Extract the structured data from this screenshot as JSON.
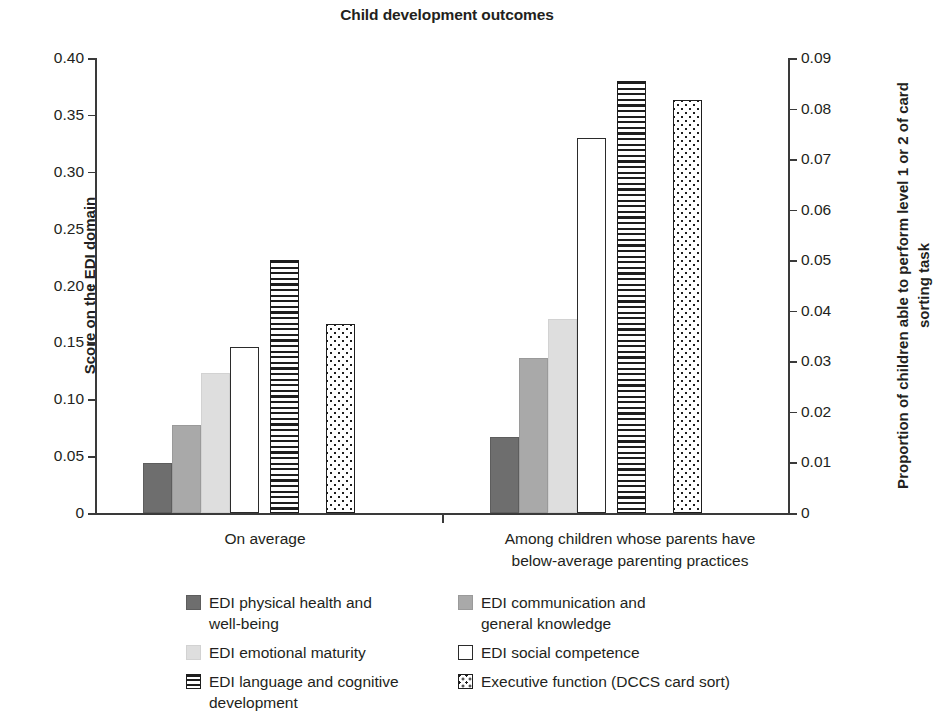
{
  "chart_data": {
    "type": "bar",
    "title": "Child development outcomes",
    "xlabel": "",
    "ylabel": "Score on the EDI domain",
    "y2label": "Proportion of children able to perform level 1 or 2 of card sorting task",
    "grid": false,
    "legend_position": "bottom",
    "ylim": [
      0,
      0.4
    ],
    "y2lim": [
      0,
      0.09
    ],
    "yticks": [
      "0",
      "0.05",
      "0.10",
      "0.15",
      "0.20",
      "0.25",
      "0.30",
      "0.35",
      "0.40"
    ],
    "ytick_values": [
      0,
      0.05,
      0.1,
      0.15,
      0.2,
      0.25,
      0.3,
      0.35,
      0.4
    ],
    "y2ticks": [
      "0",
      "0.01",
      "0.02",
      "0.03",
      "0.04",
      "0.05",
      "0.06",
      "0.07",
      "0.08",
      "0.09"
    ],
    "y2tick_values": [
      0,
      0.01,
      0.02,
      0.03,
      0.04,
      0.05,
      0.06,
      0.07,
      0.08,
      0.09
    ],
    "categories": [
      "On average",
      "Among children whose parents have below-average parenting practices"
    ],
    "category_lines": [
      [
        "On average"
      ],
      [
        "Among children whose parents have",
        "below-average parenting practices"
      ]
    ],
    "series": [
      {
        "name": "EDI physical health and well-being",
        "axis": "left",
        "pattern": "solid-dark",
        "color": "#6e6e6e",
        "values": [
          0.044,
          0.067
        ]
      },
      {
        "name": "EDI communication and general knowledge",
        "axis": "left",
        "pattern": "solid-medium",
        "color": "#a9a9a9",
        "values": [
          0.077,
          0.136
        ]
      },
      {
        "name": "EDI emotional maturity",
        "axis": "left",
        "pattern": "solid-light",
        "color": "#dedede",
        "values": [
          0.123,
          0.171
        ]
      },
      {
        "name": "EDI social competence",
        "axis": "left",
        "pattern": "open-outline",
        "color": "#ffffff",
        "values": [
          0.146,
          0.33
        ]
      },
      {
        "name": "EDI language and cognitive development",
        "axis": "left",
        "pattern": "horizontal-stripes",
        "color": "#1e1e1e",
        "values": [
          0.222,
          0.38
        ]
      },
      {
        "name": "Executive function (DCCS card sort)",
        "axis": "right",
        "pattern": "checkered-dots",
        "color": "#1e1e1e",
        "values": [
          0.0375,
          0.0817
        ],
        "values_left_scale": [
          0.1665,
          0.363
        ]
      }
    ]
  },
  "legend": {
    "left_column": [
      {
        "label_line1": "EDI physical health and",
        "label_line2": "well-being",
        "swatch": "solid-dark-swatch"
      },
      {
        "label_line1": "EDI emotional maturity",
        "label_line2": "",
        "swatch": "solid-light-swatch"
      },
      {
        "label_line1": "EDI language and cognitive",
        "label_line2": "development",
        "swatch": "horizontal-stripes-swatch"
      }
    ],
    "right_column": [
      {
        "label_line1": "EDI communication and",
        "label_line2": "general knowledge",
        "swatch": "solid-medium-swatch"
      },
      {
        "label_line1": "EDI social competence",
        "label_line2": "",
        "swatch": "open-outline-swatch"
      },
      {
        "label_line1": "Executive function (DCCS card sort)",
        "label_line2": "",
        "swatch": "checkered-dots-swatch"
      }
    ]
  },
  "colors": {
    "axis": "#3a3a3a",
    "text": "#231f20",
    "background": "#ffffff",
    "dark_gray": "#6e6e6e",
    "medium_gray": "#a9a9a9",
    "light_gray": "#dedede",
    "ink": "#1e1e1e"
  }
}
